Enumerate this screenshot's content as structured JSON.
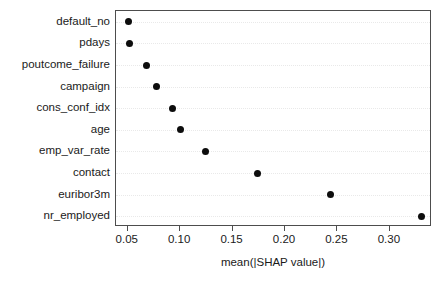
{
  "chart_data": {
    "type": "scatter",
    "title": "",
    "xlabel": "mean(|SHAP value|)",
    "ylabel": "",
    "categories": [
      "default_no",
      "pdays",
      "poutcome_failure",
      "campaign",
      "cons_conf_idx",
      "age",
      "emp_var_rate",
      "contact",
      "euribor3m",
      "nr_employed"
    ],
    "values": [
      0.051,
      0.052,
      0.068,
      0.077,
      0.093,
      0.1,
      0.124,
      0.174,
      0.243,
      0.33
    ],
    "points": [
      {
        "label": "default_no",
        "value": 0.051
      },
      {
        "label": "pdays",
        "value": 0.052
      },
      {
        "label": "poutcome_failure",
        "value": 0.068
      },
      {
        "label": "campaign",
        "value": 0.077
      },
      {
        "label": "cons_conf_idx",
        "value": 0.093
      },
      {
        "label": "age",
        "value": 0.1
      },
      {
        "label": "emp_var_rate",
        "value": 0.124
      },
      {
        "label": "contact",
        "value": 0.174
      },
      {
        "label": "euribor3m",
        "value": 0.243
      },
      {
        "label": "nr_employed",
        "value": 0.33
      }
    ],
    "xticks": [
      0.05,
      0.1,
      0.15,
      0.2,
      0.25,
      0.3
    ],
    "xticklabels": [
      "0.05",
      "0.10",
      "0.15",
      "0.20",
      "0.25",
      "0.30"
    ],
    "xlim": [
      0.0388,
      0.3402
    ],
    "ylim_categories_top_to_bottom": true,
    "grid": true,
    "grid_axis": "y",
    "grid_style": "dotted",
    "legend": null,
    "marker": "circle",
    "colors": {
      "marker": "#0d0d0d",
      "frame": "#4d4d4d",
      "grid": "#e9e9e9",
      "text": "#1a1a1a",
      "background": "#ffffff"
    }
  }
}
